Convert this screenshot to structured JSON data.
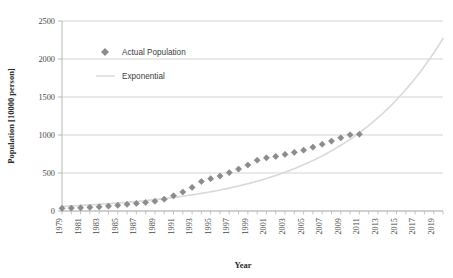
{
  "chart_data": {
    "type": "scatter",
    "title": "",
    "xlabel": "Year",
    "ylabel": "Population [10000 person]",
    "xlim": [
      1979,
      2020
    ],
    "ylim": [
      0,
      2500
    ],
    "yticks": [
      0,
      500,
      1000,
      1500,
      2000,
      2500
    ],
    "ytick_labels": [
      "0",
      "500",
      "1000",
      "1500",
      "2000",
      "2500"
    ],
    "xticks": [
      1979,
      1981,
      1983,
      1985,
      1987,
      1989,
      1991,
      1993,
      1995,
      1997,
      1999,
      2001,
      2003,
      2005,
      2007,
      2009,
      2011,
      2013,
      2015,
      2017,
      2019
    ],
    "xtick_labels": [
      "1979",
      "1981",
      "1983",
      "1985",
      "1987",
      "1989",
      "1991",
      "1993",
      "1995",
      "1997",
      "1999",
      "2001",
      "2003",
      "2005",
      "2007",
      "2009",
      "2011",
      "2013",
      "2015",
      "2017",
      "2019"
    ],
    "grid": "horizontal",
    "legend_position": "upper-left-inside",
    "series": [
      {
        "name": "Actual Population",
        "kind": "scatter",
        "marker": "diamond",
        "color": "#8c8c8c",
        "x": [
          1979,
          1980,
          1981,
          1982,
          1983,
          1984,
          1985,
          1986,
          1987,
          1988,
          1989,
          1990,
          1991,
          1992,
          1993,
          1994,
          1995,
          1996,
          1997,
          1998,
          1999,
          2000,
          2001,
          2002,
          2003,
          2004,
          2005,
          2006,
          2007,
          2008,
          2009,
          2010,
          2011
        ],
        "values": [
          35,
          38,
          42,
          48,
          55,
          65,
          75,
          88,
          100,
          112,
          128,
          155,
          200,
          250,
          310,
          388,
          425,
          460,
          505,
          552,
          605,
          668,
          700,
          718,
          745,
          772,
          800,
          840,
          878,
          920,
          963,
          1003,
          1010
        ]
      },
      {
        "name": "Exponential",
        "kind": "line",
        "color": "#d9d9d9",
        "x": [
          1979,
          1981,
          1983,
          1985,
          1987,
          1989,
          1991,
          1993,
          1995,
          1997,
          1999,
          2001,
          2003,
          2005,
          2007,
          2009,
          2011,
          2013,
          2015,
          2017,
          2019,
          2020
        ],
        "values": [
          62,
          80,
          103,
          132,
          170,
          218,
          280,
          360,
          462,
          594,
          763,
          980,
          1259,
          1617,
          2077,
          1260,
          1450,
          1660,
          1890,
          2120,
          2250,
          2270
        ]
      }
    ]
  },
  "legend": {
    "items": [
      {
        "label": "Actual Population",
        "marker": "diamond",
        "color": "#8c8c8c"
      },
      {
        "label": "Exponential",
        "marker": "line",
        "color": "#d9d9d9"
      }
    ]
  },
  "axes": {
    "x_title": "Year",
    "y_title": "Population [10000 person]"
  }
}
